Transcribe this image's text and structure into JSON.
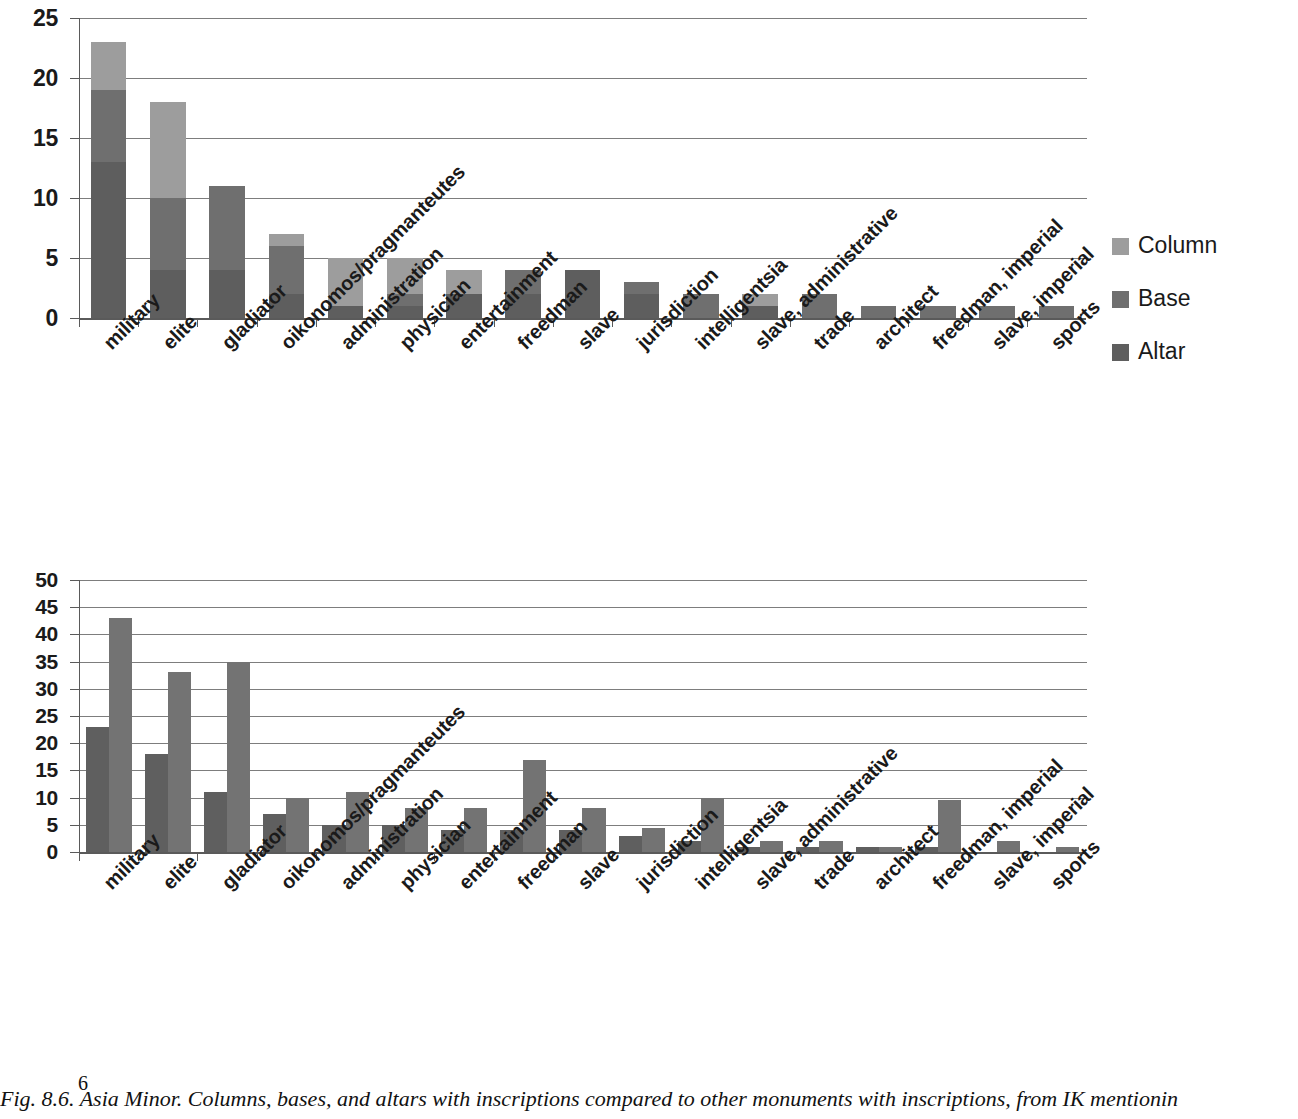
{
  "caption": "Fig. 8.6. Asia Minor. Columns, bases, and altars with inscriptions compared to other monuments with inscriptions, from IK mentionin",
  "page_number": "6",
  "colors": {
    "altar": "#5e5e5e",
    "base": "#6f6f6f",
    "column": "#9d9d9d",
    "total": "#5f5f5f",
    "other": "#737373",
    "gridline": "#7d7d7d",
    "axis": "#5a5a5a"
  },
  "chart_data": [
    {
      "id": "top",
      "type": "bar",
      "stacked": true,
      "title": "",
      "xlabel": "",
      "ylabel": "",
      "ylim": [
        0,
        25
      ],
      "yticks": [
        0,
        5,
        10,
        15,
        20,
        25
      ],
      "grid": true,
      "legend_position": "right",
      "categories": [
        "military",
        "elite",
        "gladiator",
        "oikonomos/pragmanteutes",
        "administration",
        "physician",
        "entertainment",
        "freedman",
        "slave",
        "jurisdiction",
        "intelligentsia",
        "slave, administrative",
        "trade",
        "architect",
        "freedman, imperial",
        "slave, imperial",
        "sports"
      ],
      "series": [
        {
          "name": "Altar",
          "color": "#5e5e5e",
          "values": [
            13,
            4,
            4,
            2,
            1,
            1,
            2,
            2,
            4,
            2,
            0,
            1,
            0,
            0,
            0,
            0,
            0
          ]
        },
        {
          "name": "Base",
          "color": "#6f6f6f",
          "values": [
            6,
            6,
            7,
            4,
            0,
            1,
            0,
            2,
            0,
            1,
            2,
            0,
            2,
            1,
            1,
            1,
            1
          ]
        },
        {
          "name": "Column",
          "color": "#9d9d9d",
          "values": [
            4,
            8,
            0,
            1,
            4,
            3,
            2,
            0,
            0,
            0,
            0,
            1,
            0,
            0,
            0,
            0,
            0
          ]
        }
      ],
      "totals": [
        23,
        18,
        11,
        7,
        5,
        5,
        4,
        4,
        4,
        3,
        2,
        2,
        2,
        1,
        1,
        1,
        1
      ]
    },
    {
      "id": "bottom",
      "type": "bar",
      "stacked": false,
      "title": "",
      "xlabel": "",
      "ylabel": "",
      "ylim": [
        0,
        50
      ],
      "yticks": [
        0,
        5,
        10,
        15,
        20,
        25,
        30,
        35,
        40,
        45,
        50
      ],
      "grid": true,
      "legend_position": "right",
      "categories": [
        "military",
        "elite",
        "gladiator",
        "oikonomos/pragmanteutes",
        "administration",
        "physician",
        "entertainment",
        "freedman",
        "slave",
        "jurisdiction",
        "intelligentsia",
        "slave, administrative",
        "trade",
        "architect",
        "freedman, imperial",
        "slave, imperial",
        "sports"
      ],
      "series": [
        {
          "name": "total (column, base, altar)",
          "color": "#5f5f5f",
          "values": [
            23,
            18,
            11,
            7,
            5,
            5,
            4,
            4,
            4,
            3,
            2,
            1,
            1,
            1,
            1,
            0,
            0
          ]
        },
        {
          "name": "other (known types)",
          "color": "#737373",
          "values": [
            43,
            33,
            35,
            10,
            11,
            8,
            8,
            17,
            8,
            4.5,
            10,
            2,
            2,
            1,
            9.5,
            2,
            1
          ]
        }
      ]
    }
  ]
}
